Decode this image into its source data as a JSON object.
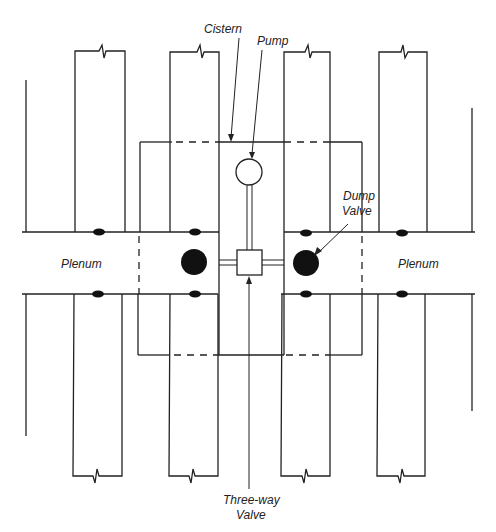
{
  "diagram": {
    "type": "schematic",
    "colors": {
      "line": "#222222",
      "fill": "#111111",
      "background": "#ffffff"
    },
    "labels": {
      "cistern": "Cistern",
      "pump": "Pump",
      "dump_valve_line1": "Dump",
      "dump_valve_line2": "Valve",
      "plenum_left": "Plenum",
      "plenum_right": "Plenum",
      "three_way_line1": "Three-way",
      "three_way_line2": "Valve"
    },
    "components": [
      {
        "name": "Cistern",
        "shape": "rectangle (dashed where crossing plenum/ducts)"
      },
      {
        "name": "Pump",
        "shape": "open circle"
      },
      {
        "name": "Three-way Valve",
        "shape": "open square"
      },
      {
        "name": "Dump Valve",
        "shape": "filled circle",
        "count": 2
      },
      {
        "name": "Plenum",
        "count": 2
      },
      {
        "name": "Duct",
        "count": 8,
        "ends": "break symbol"
      },
      {
        "name": "Duct outlet",
        "shape": "filled ellipse",
        "count": 8
      }
    ]
  }
}
